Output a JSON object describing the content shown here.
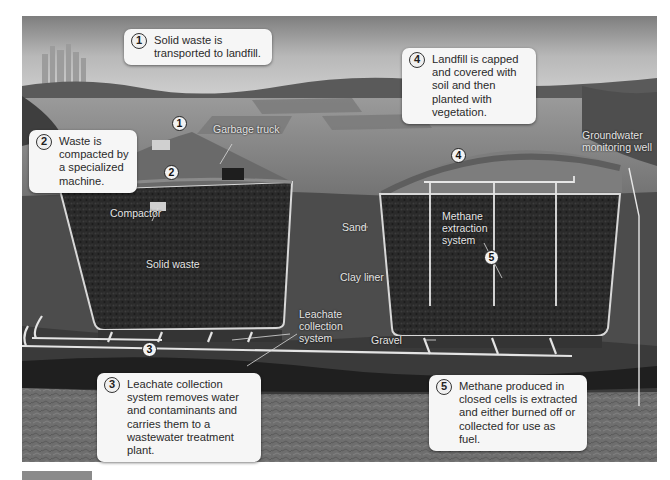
{
  "diagram": {
    "type": "landfill-cross-section",
    "palette": {
      "sky": "#b9b9b9",
      "field": "#8c8c8c",
      "soil": "#4a4a4a",
      "waste": "#262626",
      "liner": "#d8d8d8",
      "bedrock": "#6c6c6c",
      "callout_bg": "#f6f6f6"
    }
  },
  "callouts": [
    {
      "number": "1",
      "text": "Solid waste is transported to landfill."
    },
    {
      "number": "2",
      "text": "Waste is compacted by a specialized machine."
    },
    {
      "number": "3",
      "text": "Leachate collection system removes water and contaminants and carries them to a wastewater treatment plant."
    },
    {
      "number": "4",
      "text": "Landfill is capped and covered with soil and then planted with vegetation."
    },
    {
      "number": "5",
      "text": "Methane produced in closed cells is extracted and either burned off or collected for use as fuel."
    }
  ],
  "markers": [
    "1",
    "2",
    "3",
    "4",
    "5"
  ],
  "labels": {
    "garbage_truck": "Garbage truck",
    "compactor": "Compactor",
    "solid_waste": "Solid waste",
    "leachate": "Leachate collection system",
    "sand": "Sand",
    "clay_liner": "Clay liner",
    "gravel": "Gravel",
    "methane": "Methane extraction system",
    "groundwater": "Groundwater monitoring well"
  }
}
